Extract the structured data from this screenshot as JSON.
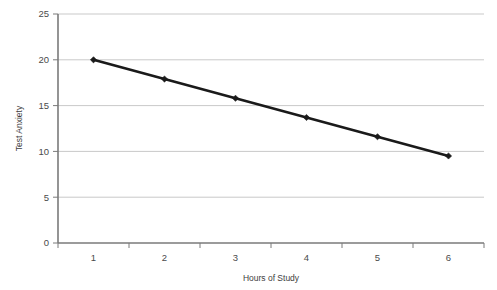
{
  "chart_data": {
    "type": "line",
    "title": "",
    "xlabel": "Hours of Study",
    "ylabel": "Test Anxiety",
    "categories": [
      1,
      2,
      3,
      4,
      5,
      6
    ],
    "x_tick_labels": [
      "1",
      "2",
      "3",
      "4",
      "5",
      "6"
    ],
    "y_tick_labels": [
      "0",
      "5",
      "10",
      "15",
      "20",
      "25"
    ],
    "y_ticks": [
      0,
      5,
      10,
      15,
      20,
      25
    ],
    "ylim": [
      0,
      25
    ],
    "values": [
      20.0,
      17.9,
      15.8,
      13.7,
      11.6,
      9.5
    ],
    "series": [
      {
        "name": "Test Anxiety",
        "values": [
          20.0,
          17.9,
          15.8,
          13.7,
          11.6,
          9.5
        ]
      }
    ],
    "grid": "horizontal",
    "legend": "none",
    "marker": "diamond",
    "line_color": "#1a1a1a",
    "marker_color": "#1a1a1a",
    "gridline_color": "#c9c9c9",
    "axis_color": "#7a7a7a",
    "background_color": "#ffffff",
    "annotations": []
  },
  "partial_cut_title": ""
}
